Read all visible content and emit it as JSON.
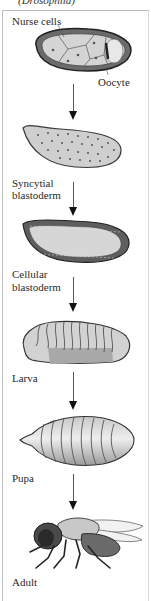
{
  "figure": {
    "organism_caption": "(Drosophila)",
    "stages": [
      {
        "id": "egg",
        "labels": [
          "Nurse cells",
          "Oocyte"
        ]
      },
      {
        "id": "syncytial",
        "label_line1": "Syncytial",
        "label_line2": "blastoderm"
      },
      {
        "id": "cellular",
        "label_line1": "Cellular",
        "label_line2": "blastoderm"
      },
      {
        "id": "larva",
        "label": "Larva"
      },
      {
        "id": "pupa",
        "label": "Pupa"
      },
      {
        "id": "adult",
        "label": "Adult"
      }
    ],
    "arrows": 5,
    "colors": {
      "cell_fill": "#cfcfcf",
      "outline": "#3a3a3a",
      "arrow": "#111111",
      "frame": "#bdbdbd"
    }
  }
}
